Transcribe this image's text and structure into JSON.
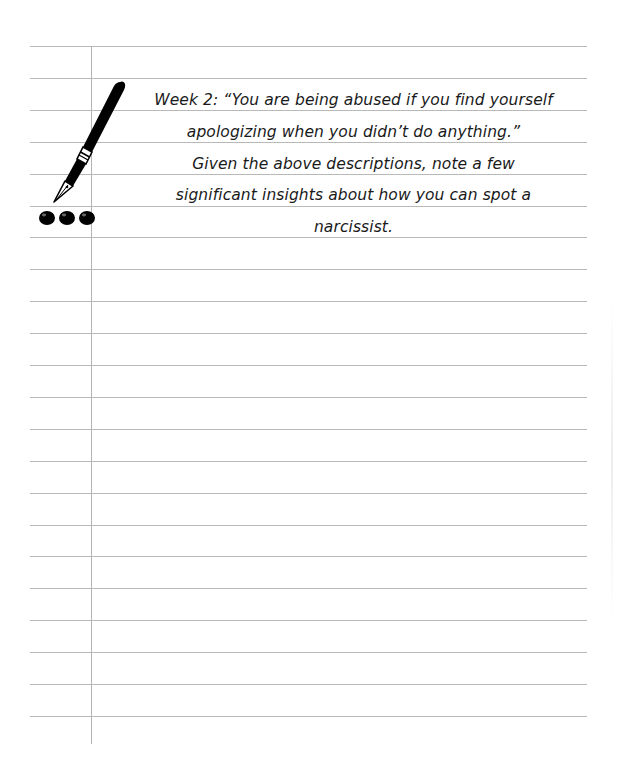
{
  "page": {
    "type": "lined-journal-page",
    "background_color": "#ffffff",
    "line_color": "#b9b9b9",
    "margin_line_color": "#b4b4b4",
    "ruled_line_count": 22
  },
  "decoration": {
    "pen_icon": "fountain-pen-icon",
    "ink_dots_icon": "ink-drops-icon",
    "ink_color": "#000000"
  },
  "prompt": {
    "lines": [
      "Week 2: “You are being abused if you find yourself",
      "apologizing when you didn’t do anything.”",
      "Given the above descriptions, note a few",
      "significant insights about how you can spot a",
      "narcissist."
    ]
  }
}
